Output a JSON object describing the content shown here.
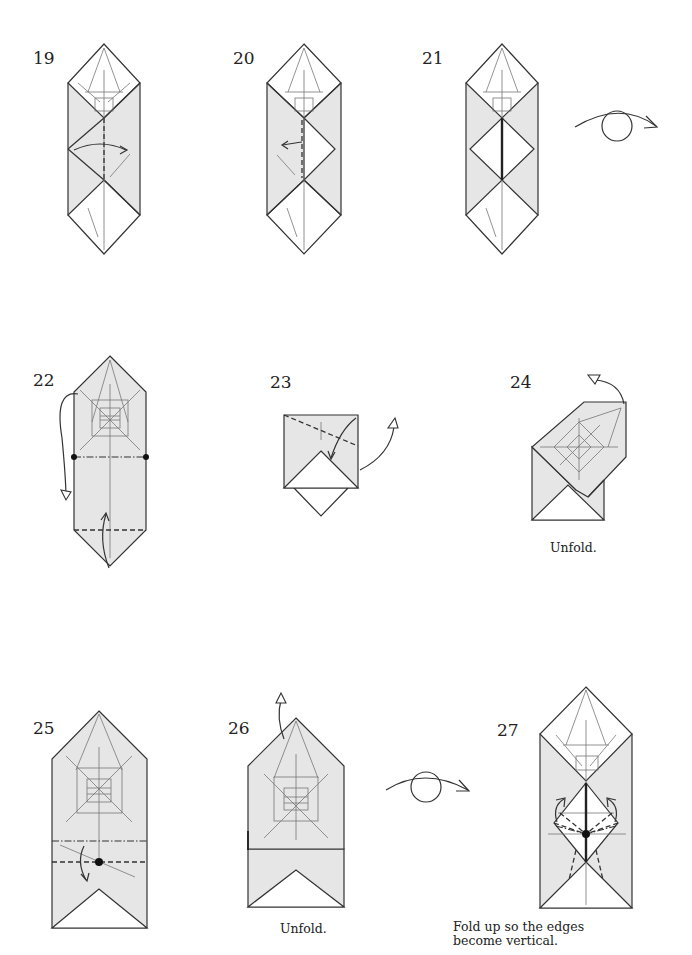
{
  "page": {
    "background": "#ffffff",
    "paper_color": "#e6e6e6",
    "line_color": "#333333"
  },
  "steps": [
    {
      "number": "19",
      "caption": "",
      "symbols": [
        "valley-fold-line",
        "fold-arrow"
      ]
    },
    {
      "number": "20",
      "caption": "",
      "symbols": [
        "valley-fold-line",
        "fold-arrow"
      ]
    },
    {
      "number": "21",
      "caption": "",
      "symbols": [
        "turn-over-symbol"
      ]
    },
    {
      "number": "22",
      "caption": "",
      "symbols": [
        "mountain-fold-line",
        "valley-fold-line",
        "fold-arrow",
        "reference-dots"
      ]
    },
    {
      "number": "23",
      "caption": "",
      "symbols": [
        "valley-fold-line",
        "fold-and-unfold-arrow"
      ]
    },
    {
      "number": "24",
      "caption": "Unfold.",
      "symbols": [
        "unfold-arrow"
      ]
    },
    {
      "number": "25",
      "caption": "",
      "symbols": [
        "mountain-fold-line",
        "valley-fold-line",
        "fold-arrow",
        "reference-dot"
      ]
    },
    {
      "number": "26",
      "caption": "Unfold.",
      "symbols": [
        "unfold-arrow",
        "turn-over-symbol"
      ]
    },
    {
      "number": "27",
      "caption_line1": "Fold up so the edges",
      "caption_line2": "become vertical.",
      "symbols": [
        "valley-fold-line",
        "mountain-fold-line",
        "fold-arrow",
        "reference-dot"
      ]
    }
  ]
}
